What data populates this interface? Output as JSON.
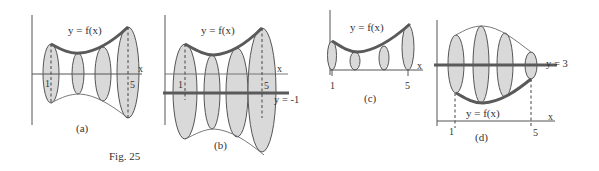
{
  "figure": {
    "caption": "Fig. 25",
    "colors": {
      "ellipse_fill": "#d9d9d9",
      "line": "#555555",
      "text": "#333333"
    }
  },
  "panels": [
    {
      "id": "a",
      "label": "(a)",
      "curve_label": "y = f(x)",
      "axis_label": "x",
      "tick_1": "1",
      "tick_5": "5",
      "axis_of_rotation": "x-axis"
    },
    {
      "id": "b",
      "label": "(b)",
      "curve_label": "y = f(x)",
      "axis_label": "x",
      "tick_1": "1",
      "tick_5": "5",
      "rotation_line_label": "y = -1"
    },
    {
      "id": "c",
      "label": "(c)",
      "curve_label": "y = f(x)",
      "axis_label": "x",
      "tick_1": "1",
      "tick_5": "5"
    },
    {
      "id": "d",
      "label": "(d)",
      "curve_label": "y = f(x)",
      "axis_label": "x",
      "tick_1": "1",
      "tick_5": "5",
      "rotation_line_label": "y = 3"
    }
  ]
}
